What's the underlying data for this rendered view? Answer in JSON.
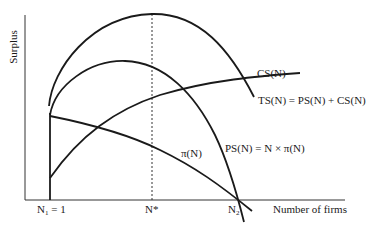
{
  "diagram": {
    "y_axis_label": "Surplus",
    "x_axis_label": "Number of firms",
    "x_ticks": {
      "n1": "N",
      "n1_sub": "1",
      "n1_suffix": " = 1",
      "n_star": "N*",
      "n2": "N",
      "n2_sub": "2"
    },
    "curves": {
      "cs": "CS(N)",
      "ts": "TS(N) = PS(N) + CS(N)",
      "ps": "PS(N) = N × π(N)",
      "pi": "π(N)"
    },
    "colors": {
      "line": "#1a1a1a",
      "background": "#ffffff"
    }
  }
}
